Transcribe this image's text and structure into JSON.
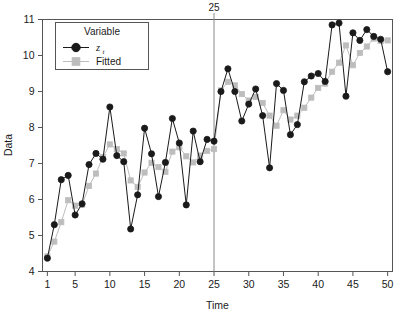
{
  "chart_data": {
    "type": "line",
    "title": "",
    "xlabel": "Time",
    "ylabel": "Data",
    "xlim": [
      0.3,
      50.7
    ],
    "ylim": [
      4,
      11
    ],
    "xticks": [
      1,
      5,
      10,
      15,
      20,
      25,
      30,
      35,
      40,
      45,
      50
    ],
    "yticks": [
      4,
      5,
      6,
      7,
      8,
      9,
      10,
      11
    ],
    "grid": false,
    "legend_position": "top-left-inside",
    "legend_title": "Variable",
    "annotations": [
      {
        "text": "25",
        "x": 25,
        "type": "vertical-reference-line",
        "color": "#808080"
      }
    ],
    "x": [
      1,
      2,
      3,
      4,
      5,
      6,
      7,
      8,
      9,
      10,
      11,
      12,
      13,
      14,
      15,
      16,
      17,
      18,
      19,
      20,
      21,
      22,
      23,
      24,
      25,
      26,
      27,
      28,
      29,
      30,
      31,
      32,
      33,
      34,
      35,
      36,
      37,
      38,
      39,
      40,
      41,
      42,
      43,
      44,
      45,
      46,
      47,
      48,
      49,
      50
    ],
    "series": [
      {
        "name": "z_t",
        "marker": "circle",
        "color": "#1a1a1a",
        "values": [
          4.37,
          5.3,
          6.55,
          6.67,
          5.57,
          5.88,
          6.97,
          7.28,
          7.12,
          8.57,
          7.22,
          7.05,
          5.18,
          6.13,
          7.98,
          7.27,
          6.08,
          7.03,
          8.25,
          7.57,
          5.85,
          7.9,
          7.05,
          7.67,
          7.62,
          9.0,
          9.63,
          9.0,
          8.18,
          8.65,
          9.07,
          8.33,
          6.88,
          9.22,
          9.03,
          7.8,
          8.08,
          9.27,
          9.43,
          9.5,
          9.28,
          10.85,
          10.9,
          8.87,
          10.63,
          10.42,
          10.72,
          10.53,
          10.45,
          9.55
        ]
      },
      {
        "name": "Fitted",
        "marker": "square",
        "color": "#bdbdbd",
        "values": [
          4.42,
          4.83,
          5.37,
          5.98,
          5.83,
          5.85,
          6.38,
          6.72,
          7.18,
          7.53,
          7.4,
          7.28,
          6.53,
          6.35,
          6.75,
          7.02,
          6.9,
          6.77,
          7.33,
          7.45,
          7.2,
          7.03,
          7.22,
          7.35,
          7.4,
          9.03,
          9.27,
          9.17,
          8.93,
          8.75,
          8.85,
          8.68,
          8.33,
          8.05,
          8.48,
          8.22,
          8.33,
          8.55,
          8.83,
          9.1,
          9.22,
          9.55,
          9.8,
          10.28,
          9.73,
          10.07,
          10.25,
          10.47,
          10.4,
          10.42
        ]
      }
    ]
  },
  "legend": {
    "title": "Variable",
    "items": [
      {
        "label": "z",
        "subscript": "t",
        "marker": "circle",
        "color": "#1a1a1a"
      },
      {
        "label": "Fitted",
        "subscript": "",
        "marker": "square",
        "color": "#bdbdbd"
      }
    ]
  },
  "axes": {
    "x_title": "Time",
    "y_title": "Data",
    "x_tick_labels": [
      "1",
      "5",
      "10",
      "15",
      "20",
      "25",
      "30",
      "35",
      "40",
      "45",
      "50"
    ],
    "y_tick_labels": [
      "4",
      "5",
      "6",
      "7",
      "8",
      "9",
      "10",
      "11"
    ]
  },
  "reference_line": {
    "label": "25",
    "value": 25
  },
  "colors": {
    "observed": "#1a1a1a",
    "fitted": "#bdbdbd",
    "frame": "#555555",
    "reference": "#8a8a8a",
    "background": "#ffffff"
  }
}
